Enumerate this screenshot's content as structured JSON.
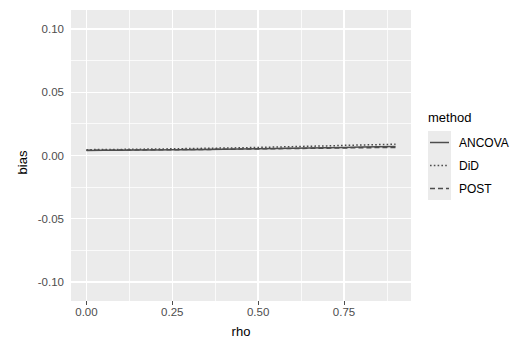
{
  "chart_data": {
    "type": "line",
    "title": "",
    "xlabel": "rho",
    "ylabel": "bias",
    "xlim": [
      -0.045,
      0.945
    ],
    "ylim": [
      -0.115,
      0.115
    ],
    "xticks": [
      "0.00",
      "0.25",
      "0.50",
      "0.75"
    ],
    "xtick_values": [
      0.0,
      0.25,
      0.5,
      0.75
    ],
    "yticks": [
      "0.10",
      "0.05",
      "0.00",
      "-0.05",
      "-0.10"
    ],
    "ytick_values": [
      0.1,
      0.05,
      0.0,
      -0.05,
      -0.1
    ],
    "x_minor_values": [
      0.125,
      0.375,
      0.625,
      0.875
    ],
    "y_minor_values": [
      0.075,
      0.025,
      -0.025,
      -0.075
    ],
    "grid": true,
    "legend_position": "right",
    "legend_title": "method",
    "x": [
      0.0,
      0.05,
      0.1,
      0.15,
      0.2,
      0.25,
      0.3,
      0.35,
      0.4,
      0.45,
      0.5,
      0.55,
      0.6,
      0.65,
      0.7,
      0.75,
      0.8,
      0.85,
      0.9
    ],
    "series": [
      {
        "name": "ANCOVA",
        "linetype": "solid",
        "color": "#4d4d4d",
        "values": [
          0.004,
          0.0041,
          0.0042,
          0.0043,
          0.0044,
          0.0045,
          0.0046,
          0.0048,
          0.0049,
          0.0051,
          0.0053,
          0.0055,
          0.0057,
          0.0059,
          0.0062,
          0.0064,
          0.0067,
          0.0069,
          0.0071
        ]
      },
      {
        "name": "DiD",
        "linetype": "dotted",
        "color": "#4d4d4d",
        "values": [
          0.0046,
          0.0047,
          0.0048,
          0.005,
          0.0051,
          0.0053,
          0.0055,
          0.0057,
          0.0059,
          0.0061,
          0.0064,
          0.0067,
          0.007,
          0.0073,
          0.0076,
          0.008,
          0.0083,
          0.0086,
          0.0089
        ]
      },
      {
        "name": "POST",
        "linetype": "dashed",
        "color": "#4d4d4d",
        "values": [
          0.0041,
          0.0042,
          0.0043,
          0.0044,
          0.0045,
          0.0046,
          0.0047,
          0.0048,
          0.0049,
          0.0051,
          0.0052,
          0.0054,
          0.0055,
          0.0057,
          0.0058,
          0.006,
          0.0061,
          0.0063,
          0.0064
        ]
      }
    ]
  },
  "legend": {
    "title": "method",
    "items": [
      {
        "label": "ANCOVA",
        "linetype": "solid"
      },
      {
        "label": "DiD",
        "linetype": "dotted"
      },
      {
        "label": "POST",
        "linetype": "dashed"
      }
    ]
  },
  "colors": {
    "panel_background": "#ebebeb",
    "grid": "#ffffff",
    "line": "#4d4d4d",
    "axis_text": "#4d4d4d",
    "axis_title": "#000000",
    "page_background": "#ffffff"
  }
}
